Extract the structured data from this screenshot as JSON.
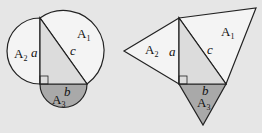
{
  "figures": {
    "left": {
      "shape": "semicircles",
      "labels": {
        "A1": "A",
        "A1_sub": "1",
        "A2": "A",
        "A2_sub": "2",
        "A3": "A",
        "A3_sub": "3",
        "a": "a",
        "b": "b",
        "c": "c"
      }
    },
    "right": {
      "shape": "triangles",
      "labels": {
        "A1": "A",
        "A1_sub": "1",
        "A2": "A",
        "A2_sub": "2",
        "A3": "A",
        "A3_sub": "3",
        "a": "a",
        "b": "b",
        "c": "c"
      }
    }
  },
  "colors": {
    "background": "#e6e6e6",
    "light_fill": "#f4f4f4",
    "triangle_fill": "#dcdcdc",
    "dark_fill": "#a9a9a9",
    "stroke": "#222222"
  }
}
